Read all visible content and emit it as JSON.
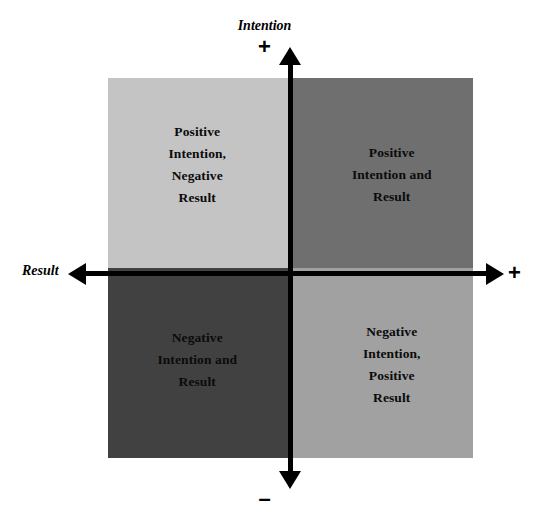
{
  "diagram": {
    "axes": {
      "vertical": {
        "label": "Intention",
        "positive_sign": "+",
        "negative_sign": "–"
      },
      "horizontal": {
        "label": "Result",
        "positive_sign": "+",
        "negative_sign": "–"
      }
    },
    "quadrants": [
      {
        "id": "top-left",
        "intention": "Positive",
        "result": "Negative",
        "label": "Positive\nIntention,\nNegative\nResult",
        "fill": "#c4c4c4"
      },
      {
        "id": "top-right",
        "intention": "Positive",
        "result": "Positive",
        "label": "Positive\nIntention and\nResult",
        "fill": "#6f6f6f"
      },
      {
        "id": "bottom-left",
        "intention": "Negative",
        "result": "Negative",
        "label": "Negative\nIntention and\nResult",
        "fill": "#414141"
      },
      {
        "id": "bottom-right",
        "intention": "Negative",
        "result": "Positive",
        "label": "Negative\nIntention,\nPositive\nResult",
        "fill": "#a1a1a1"
      }
    ],
    "colors": {
      "axis": "#000000",
      "text": "#0b0b0b",
      "background": "#ffffff"
    }
  }
}
